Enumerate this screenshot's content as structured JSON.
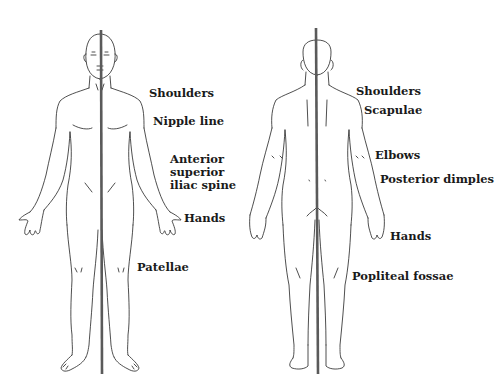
{
  "figures": {
    "anterior": {
      "labels": [
        {
          "text": "Shoulders"
        },
        {
          "text": "Nipple line"
        },
        {
          "text": "Anterior"
        },
        {
          "text": "superior"
        },
        {
          "text": "iliac spine"
        },
        {
          "text": "Hands"
        },
        {
          "text": "Patellae"
        }
      ]
    },
    "posterior": {
      "labels": [
        {
          "text": "Shoulders"
        },
        {
          "text": "Scapulae"
        },
        {
          "text": "Elbows"
        },
        {
          "text": "Posterior dimples"
        },
        {
          "text": "Hands"
        },
        {
          "text": "Popliteal fossae"
        }
      ]
    }
  },
  "colors": {
    "plumb_line": "#5a5a5a",
    "outline": "#222222",
    "text": "#1a1a1a",
    "background": "#ffffff"
  }
}
